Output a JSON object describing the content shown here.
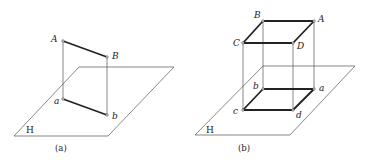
{
  "figure": {
    "panels": [
      {
        "id": "a",
        "caption": "(a)",
        "plane_label": "H",
        "points": {
          "A": {
            "label": "A"
          },
          "B": {
            "label": "B"
          },
          "a": {
            "label": "a"
          },
          "b": {
            "label": "b"
          }
        }
      },
      {
        "id": "b",
        "caption": "(b)",
        "plane_label": "H",
        "points": {
          "A": {
            "label": "A"
          },
          "B": {
            "label": "B"
          },
          "C": {
            "label": "C"
          },
          "D": {
            "label": "D"
          },
          "a": {
            "label": "a"
          },
          "b": {
            "label": "b"
          },
          "c": {
            "label": "c"
          },
          "d": {
            "label": "d"
          }
        }
      }
    ]
  }
}
